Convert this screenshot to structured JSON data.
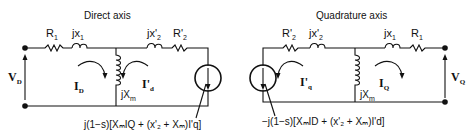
{
  "direct": {
    "title": "Direct axis",
    "R1": {
      "base": "R",
      "sub": "1"
    },
    "jx1": {
      "base": "jx",
      "sub": "1"
    },
    "jx2": {
      "base": "jx'",
      "sub": "2"
    },
    "R2": {
      "base": "R'",
      "sub": "2"
    },
    "V": {
      "base": "V",
      "sub": "D"
    },
    "I_main": {
      "base": "I",
      "sub": "D"
    },
    "I_rotor": {
      "base": "I'",
      "sub": "d"
    },
    "jXm": {
      "base": "jX",
      "sub": "m"
    },
    "source_expr": "j(1−s)[XₘIQ + (x'₂ + Xₘ)I'q]"
  },
  "quadrature": {
    "title": "Quadrature axis",
    "R2": {
      "base": "R'",
      "sub": "2"
    },
    "jx2": {
      "base": "jx'",
      "sub": "2"
    },
    "jx1": {
      "base": "jx",
      "sub": "1"
    },
    "R1": {
      "base": "R",
      "sub": "1"
    },
    "V": {
      "base": "V",
      "sub": "Q"
    },
    "I_main": {
      "base": "I",
      "sub": "Q"
    },
    "I_rotor": {
      "base": "I'",
      "sub": "q"
    },
    "jXm": {
      "base": "jX",
      "sub": "m"
    },
    "source_expr": "−j(1−s)[XₘID + (x'₂ + Xₘ)I'd]"
  }
}
